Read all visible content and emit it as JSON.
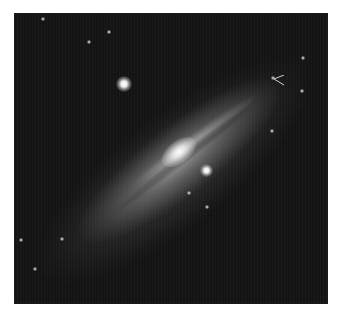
{
  "image": {
    "subject": "spiral galaxy (grayscale astronomical photograph)",
    "colors": {
      "sky": "#151515",
      "core": "#ffffff",
      "page_background": "#ffffff"
    },
    "features": [
      "bright galactic core",
      "dusty spiral arms",
      "foreground star upper-left",
      "foreground star lower-right of core",
      "marked object with arrow near upper-right arm"
    ]
  },
  "caption": {
    "text": "",
    "note": "caption line truncated at bottom edge; glyphs not legible"
  }
}
